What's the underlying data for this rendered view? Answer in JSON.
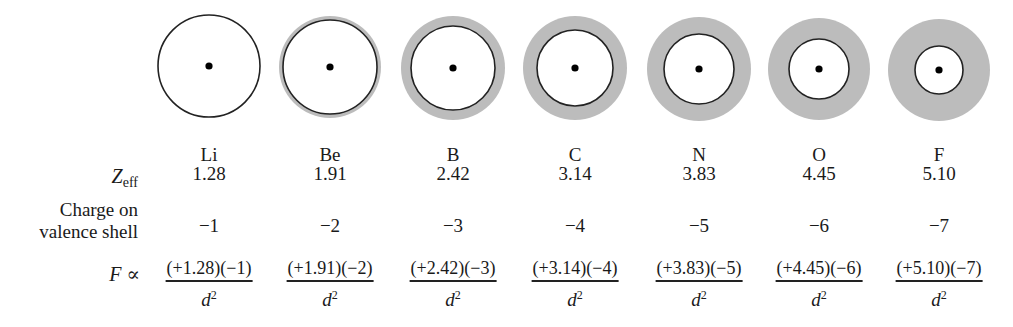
{
  "figure": {
    "row_labels": {
      "zeff_main": "Z",
      "zeff_sub": "eff",
      "charge_line1": "Charge on",
      "charge_line2": "valence shell",
      "force_symbol": "F",
      "force_relation": " ∝"
    },
    "denominator": "d",
    "denominator_exp": "2",
    "colors": {
      "shell_shading": "#bcbcbc",
      "outline": "#222222",
      "nucleus": "#000000"
    },
    "elements": [
      {
        "symbol": "Li",
        "zeff": "1.28",
        "charge": "−1",
        "numerator": "(+1.28)(−1)",
        "cx": 209,
        "cy": 66,
        "outer_r": 51,
        "inner_r": 51
      },
      {
        "symbol": "Be",
        "zeff": "1.91",
        "charge": "−2",
        "numerator": "(+1.91)(−2)",
        "cx": 330,
        "cy": 67,
        "outer_r": 51,
        "inner_r": 47
      },
      {
        "symbol": "B",
        "zeff": "2.42",
        "charge": "−3",
        "numerator": "(+2.42)(−3)",
        "cx": 453,
        "cy": 68,
        "outer_r": 52,
        "inner_r": 42
      },
      {
        "symbol": "C",
        "zeff": "3.14",
        "charge": "−4",
        "numerator": "(+3.14)(−4)",
        "cx": 575,
        "cy": 68,
        "outer_r": 52,
        "inner_r": 38
      },
      {
        "symbol": "N",
        "zeff": "3.83",
        "charge": "−5",
        "numerator": "(+3.83)(−5)",
        "cx": 699,
        "cy": 69,
        "outer_r": 52,
        "inner_r": 35
      },
      {
        "symbol": "O",
        "zeff": "4.45",
        "charge": "−6",
        "numerator": "(+4.45)(−6)",
        "cx": 819,
        "cy": 69,
        "outer_r": 51,
        "inner_r": 30
      },
      {
        "symbol": "F",
        "zeff": "5.10",
        "charge": "−7",
        "numerator": "(+5.10)(−7)",
        "cx": 939,
        "cy": 70,
        "outer_r": 51,
        "inner_r": 24
      }
    ]
  }
}
